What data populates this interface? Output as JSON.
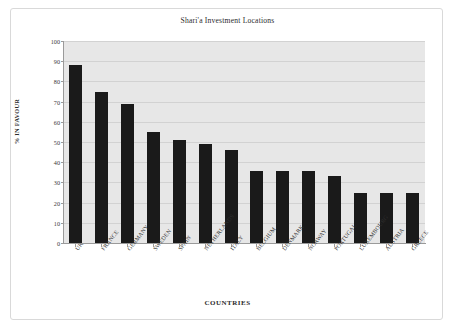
{
  "chart_data": {
    "type": "bar",
    "title": "Shari'a Investment Locations",
    "xlabel": "COUNTRIES",
    "ylabel": "% IN FAVOUR",
    "ylim": [
      0,
      100
    ],
    "ytick_step": 10,
    "yticks": [
      "100",
      "90",
      "80",
      "70",
      "60",
      "50",
      "40",
      "30",
      "20",
      "10",
      "0"
    ],
    "grid": true,
    "legend": null,
    "legend_position": "none",
    "bar_color": "#1a1a1a",
    "plot_background": "#e7e7e7",
    "categories": [
      "UK",
      "FRANCE",
      "GERMANY",
      "SWEDEN",
      "SPAIN",
      "NETHERLANDS",
      "ITALY",
      "BELGIUM",
      "DENMARK",
      "NORWAY",
      "PORTUGAL",
      "LUXEMBOURG",
      "AUSTRIA",
      "GREECE"
    ],
    "values": [
      88,
      75,
      69,
      55,
      51,
      49,
      46,
      35.5,
      35.5,
      35.5,
      33,
      25,
      25,
      25
    ]
  }
}
